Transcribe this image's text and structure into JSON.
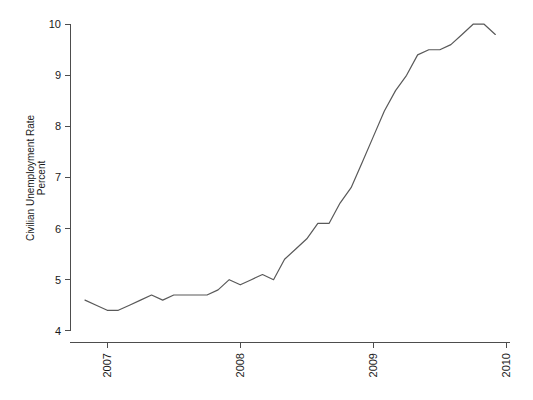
{
  "chart_data": {
    "type": "line",
    "title": "",
    "subtitle": "",
    "xlabel": "",
    "ylabel": "Civilian Unemployment Rate\nPercent",
    "ylabel_line1": "Civilian Unemployment Rate",
    "ylabel_line2": "Percent",
    "grid": false,
    "legend": "none",
    "x_tick_labels": [
      "2007",
      "2008",
      "2009",
      "2010"
    ],
    "x_tick_values": [
      2007,
      2008,
      2009,
      2010
    ],
    "y_tick_labels": [
      "4",
      "5",
      "6",
      "7",
      "8",
      "9",
      "10"
    ],
    "y_tick_values": [
      4,
      5,
      6,
      7,
      8,
      9,
      10
    ],
    "xlim": [
      2006.72,
      2010.05
    ],
    "ylim": [
      3.78,
      10.2
    ],
    "line_color": "#595959",
    "x": [
      2006.833,
      2006.917,
      2007.0,
      2007.083,
      2007.167,
      2007.25,
      2007.333,
      2007.417,
      2007.5,
      2007.583,
      2007.667,
      2007.75,
      2007.833,
      2007.917,
      2008.0,
      2008.083,
      2008.167,
      2008.25,
      2008.333,
      2008.417,
      2008.5,
      2008.583,
      2008.667,
      2008.75,
      2008.833,
      2008.917,
      2009.0,
      2009.083,
      2009.167,
      2009.25,
      2009.333,
      2009.417,
      2009.5,
      2009.583,
      2009.667,
      2009.75,
      2009.833,
      2009.917
    ],
    "y": [
      4.6,
      4.5,
      4.4,
      4.4,
      4.5,
      4.6,
      4.7,
      4.6,
      4.7,
      4.7,
      4.7,
      4.7,
      4.8,
      5.0,
      4.9,
      5.0,
      5.1,
      5.0,
      5.4,
      5.6,
      5.8,
      6.1,
      6.1,
      6.5,
      6.8,
      7.3,
      7.8,
      8.3,
      8.7,
      9.0,
      9.4,
      9.5,
      9.5,
      9.6,
      9.8,
      10.0,
      10.0,
      9.8
    ],
    "series": [
      {
        "name": "Civilian Unemployment Rate",
        "values": [
          4.6,
          4.5,
          4.4,
          4.4,
          4.5,
          4.6,
          4.7,
          4.6,
          4.7,
          4.7,
          4.7,
          4.7,
          4.8,
          5.0,
          4.9,
          5.0,
          5.1,
          5.0,
          5.4,
          5.6,
          5.8,
          6.1,
          6.1,
          6.5,
          6.8,
          7.3,
          7.8,
          8.3,
          8.7,
          9.0,
          9.4,
          9.5,
          9.5,
          9.6,
          9.8,
          10.0,
          10.0,
          9.8
        ]
      }
    ],
    "layout": {
      "plot_left": 70,
      "plot_right": 513,
      "plot_top": 14,
      "plot_bottom": 342,
      "y_axis_x": 70,
      "x_axis_y": 342,
      "y_value_top": 10.2,
      "y_value_bottom": 3.78,
      "x_value_left": 2006.72,
      "x_value_right": 2010.05
    }
  }
}
